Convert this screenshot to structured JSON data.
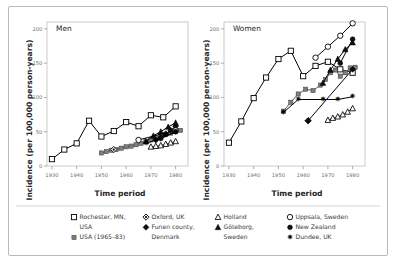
{
  "figure": {
    "axis_titles": {
      "x": "Time period",
      "y": "Incidence (per 100,000 person-years)"
    },
    "panels": [
      {
        "id": "men",
        "title": "Men"
      },
      {
        "id": "women",
        "title": "Women"
      }
    ],
    "xticks": [
      "1930",
      "1940",
      "1950",
      "1960",
      "1970",
      "1980"
    ],
    "yticks": [
      "0",
      "50",
      "100",
      "150",
      "200"
    ]
  },
  "legend": {
    "columns": [
      {
        "items": [
          {
            "marker": "open-square",
            "label": "Rochester, MN, USA"
          },
          {
            "marker": "filled-square-gray",
            "label": "USA (1965–83)"
          }
        ]
      },
      {
        "items": [
          {
            "marker": "dotted-diamond",
            "label": "Oxford, UK"
          },
          {
            "marker": "filled-diamond",
            "label": "Funen county, Denmark"
          }
        ]
      },
      {
        "items": [
          {
            "marker": "open-triangle",
            "label": "Holland"
          },
          {
            "marker": "filled-triangle",
            "label": "Göteborg, Sweden"
          }
        ]
      },
      {
        "items": [
          {
            "marker": "open-circle",
            "label": "Uppsala, Sweden"
          },
          {
            "marker": "filled-circle",
            "label": "New Zealand"
          },
          {
            "marker": "star",
            "label": "Dundee, UK"
          }
        ]
      }
    ]
  },
  "chart_data": {
    "type": "line",
    "xlabel": "Time period",
    "ylabel": "Incidence (per 100,000 person-years)",
    "xlim": [
      1928,
      1985
    ],
    "ylim": [
      0,
      210
    ],
    "grid": false,
    "legend_position": "below",
    "panels": [
      {
        "name": "Men",
        "series": [
          {
            "name": "Rochester, MN, USA",
            "marker": "open-square",
            "x": [
              1930,
              1935,
              1940,
              1945,
              1950,
              1955,
              1960,
              1965,
              1970,
              1975,
              1980
            ],
            "y": [
              10,
              24,
              33,
              66,
              43,
              51,
              64,
              58,
              74,
              71,
              87
            ]
          },
          {
            "name": "USA (1965–83)",
            "marker": "filled-square-gray",
            "x": [
              1950,
              1952,
              1954,
              1956,
              1958,
              1960,
              1962,
              1964,
              1966,
              1968,
              1970,
              1972,
              1974,
              1976,
              1978,
              1980,
              1982
            ],
            "y": [
              19,
              21,
              23,
              24,
              26,
              28,
              29,
              31,
              33,
              36,
              38,
              41,
              43,
              46,
              48,
              50,
              52
            ]
          },
          {
            "name": "Oxford, UK",
            "marker": "dotted-diamond",
            "x": [
              1955
            ],
            "y": [
              24
            ]
          },
          {
            "name": "Funen county, Denmark",
            "marker": "filled-diamond",
            "x": [
              1972,
              1974,
              1976,
              1978,
              1980
            ],
            "y": [
              38,
              42,
              47,
              52,
              58
            ]
          },
          {
            "name": "Holland",
            "marker": "open-triangle",
            "x": [
              1970,
              1972,
              1974,
              1976,
              1978,
              1980
            ],
            "y": [
              28,
              29,
              30,
              32,
              34,
              36
            ]
          },
          {
            "name": "Göteborg, Sweden",
            "marker": "filled-triangle",
            "x": [
              1968,
              1971,
              1974,
              1977,
              1980
            ],
            "y": [
              36,
              44,
              50,
              57,
              63
            ]
          },
          {
            "name": "Uppsala, Sweden",
            "marker": "open-circle",
            "x": [
              1965,
              1980
            ],
            "y": [
              38,
              52
            ]
          },
          {
            "name": "New Zealand",
            "marker": "filled-circle",
            "x": [
              1974,
              1980
            ],
            "y": [
              40,
              50
            ]
          },
          {
            "name": "Dundee, UK",
            "marker": "star",
            "x": [
              1968,
              1972,
              1976,
              1980
            ],
            "y": [
              33,
              38,
              44,
              49
            ]
          }
        ]
      },
      {
        "name": "Women",
        "series": [
          {
            "name": "Rochester, MN, USA",
            "marker": "open-square",
            "x": [
              1930,
              1935,
              1940,
              1945,
              1950,
              1955,
              1960,
              1965,
              1970,
              1975,
              1980
            ],
            "y": [
              34,
              65,
              99,
              129,
              156,
              168,
              131,
              146,
              152,
              141,
              136
            ]
          },
          {
            "name": "USA (1965–83)",
            "marker": "filled-square-gray",
            "x": [
              1952,
              1955,
              1958,
              1961,
              1964,
              1967,
              1969,
              1971,
              1973,
              1975,
              1977,
              1979,
              1981
            ],
            "y": [
              80,
              93,
              105,
              112,
              110,
              118,
              126,
              136,
              140,
              131,
              136,
              143,
              144
            ]
          },
          {
            "name": "Oxford, UK",
            "marker": "dotted-diamond",
            "x": [
              1962
            ],
            "y": [
              66
            ]
          },
          {
            "name": "Funen county, Denmark",
            "marker": "filled-diamond",
            "x": [
              1962,
              1980
            ],
            "y": [
              66,
              141
            ]
          },
          {
            "name": "Holland",
            "marker": "open-triangle",
            "x": [
              1970,
              1972,
              1974,
              1976,
              1978,
              1980
            ],
            "y": [
              67,
              70,
              72,
              75,
              79,
              84
            ]
          },
          {
            "name": "Göteborg, Sweden",
            "marker": "filled-triangle",
            "x": [
              1968,
              1971,
              1974,
              1977,
              1980
            ],
            "y": [
              121,
              140,
              156,
              170,
              180
            ]
          },
          {
            "name": "Uppsala, Sweden",
            "marker": "open-circle",
            "x": [
              1965,
              1970,
              1975,
              1980
            ],
            "y": [
              158,
              174,
              190,
              208
            ]
          },
          {
            "name": "New Zealand",
            "marker": "filled-circle",
            "x": [
              1975,
              1980
            ],
            "y": [
              150,
              185
            ]
          },
          {
            "name": "Dundee, UK",
            "marker": "star",
            "x": [
              1952,
              1958,
              1968,
              1974,
              1980
            ],
            "y": [
              78,
              97,
              97,
              97,
              101
            ]
          }
        ]
      }
    ]
  }
}
